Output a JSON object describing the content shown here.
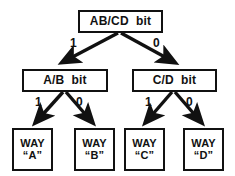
{
  "diagram": {
    "type": "binary-decision-tree",
    "title": "",
    "background_color": "#ffffff",
    "stroke_color": "#111111",
    "nodes": {
      "root": {
        "label": "AB/CD  bit",
        "level": 0
      },
      "left_mid": {
        "label": "A/B  bit",
        "level": 1
      },
      "right_mid": {
        "label": "C/D  bit",
        "level": 1
      },
      "leaf_a": {
        "line1": "WAY",
        "line2": "“A”",
        "level": 2
      },
      "leaf_b": {
        "line1": "WAY",
        "line2": "“B”",
        "level": 2
      },
      "leaf_c": {
        "line1": "WAY",
        "line2": "“C”",
        "level": 2
      },
      "leaf_d": {
        "line1": "WAY",
        "line2": "“D”",
        "level": 2
      }
    },
    "edges": [
      {
        "id": "root-to-left-mid",
        "from": "root",
        "to": "left_mid",
        "label": "1"
      },
      {
        "id": "root-to-right-mid",
        "from": "root",
        "to": "right_mid",
        "label": "0"
      },
      {
        "id": "left-mid-to-a",
        "from": "left_mid",
        "to": "leaf_a",
        "label": "1"
      },
      {
        "id": "left-mid-to-b",
        "from": "left_mid",
        "to": "leaf_b",
        "label": "0"
      },
      {
        "id": "right-mid-to-c",
        "from": "right_mid",
        "to": "leaf_c",
        "label": "1"
      },
      {
        "id": "right-mid-to-d",
        "from": "right_mid",
        "to": "leaf_d",
        "label": "0"
      }
    ]
  }
}
